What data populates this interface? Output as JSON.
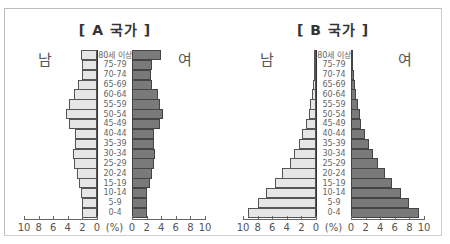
{
  "chart_data": [
    {
      "type": "bar",
      "subtype": "population-pyramid",
      "title": "[ A 국가 ]",
      "left_label": "남",
      "right_label": "여",
      "xlabel": "(%)",
      "xlim": [
        0,
        10
      ],
      "x_ticks": [
        10,
        8,
        6,
        4,
        2,
        0,
        0,
        2,
        4,
        6,
        8,
        10
      ],
      "categories": [
        "80세 이상",
        "75-79",
        "70-74",
        "65-69",
        "60-64",
        "55-59",
        "50-54",
        "45-49",
        "40-44",
        "35-39",
        "30-34",
        "25-29",
        "20-24",
        "15-19",
        "10-14",
        "5-9",
        "0-4"
      ],
      "series": [
        {
          "name": "남",
          "values": [
            2.2,
            2.1,
            2.1,
            2.6,
            3.2,
            3.8,
            4.2,
            3.8,
            3.0,
            3.0,
            3.3,
            3.2,
            2.8,
            2.5,
            2.2,
            2.1,
            2.1
          ]
        },
        {
          "name": "여",
          "values": [
            4.0,
            2.8,
            2.6,
            2.8,
            3.5,
            3.9,
            4.2,
            3.8,
            3.0,
            3.0,
            3.2,
            3.0,
            2.7,
            2.4,
            2.1,
            2.0,
            2.1
          ]
        }
      ]
    },
    {
      "type": "bar",
      "subtype": "population-pyramid",
      "title": "[ B 국가 ]",
      "left_label": "남",
      "right_label": "여",
      "xlabel": "(%)",
      "xlim": [
        0,
        10
      ],
      "x_ticks": [
        10,
        8,
        6,
        4,
        2,
        0,
        0,
        2,
        4,
        6,
        8,
        10
      ],
      "categories": [
        "80세 이상",
        "75-79",
        "70-74",
        "65-69",
        "60-64",
        "55-59",
        "50-54",
        "45-49",
        "40-44",
        "35-39",
        "30-34",
        "25-29",
        "20-24",
        "15-19",
        "10-14",
        "5-9",
        "0-4"
      ],
      "series": [
        {
          "name": "남",
          "values": [
            0.2,
            0.2,
            0.3,
            0.4,
            0.6,
            0.8,
            1.0,
            1.4,
            1.9,
            2.3,
            3.0,
            3.6,
            4.6,
            5.6,
            6.8,
            8.0,
            9.3
          ]
        },
        {
          "name": "여",
          "values": [
            0.3,
            0.2,
            0.4,
            0.5,
            0.7,
            0.9,
            1.2,
            1.4,
            1.9,
            2.5,
            3.0,
            3.7,
            4.7,
            5.6,
            6.8,
            8.0,
            9.3
          ]
        }
      ]
    }
  ],
  "colors": {
    "male_fill": "#e6e6e6",
    "female_fill": "#7a7a7a",
    "bar_border": "#555555"
  }
}
